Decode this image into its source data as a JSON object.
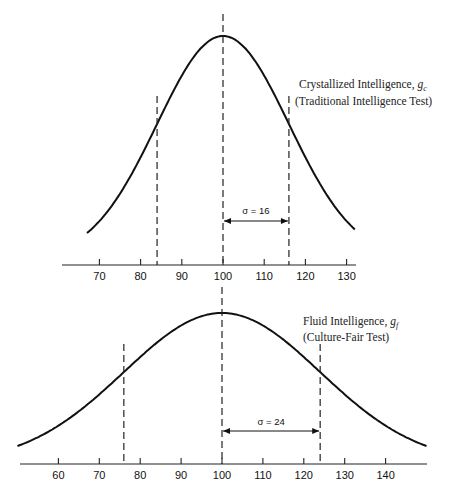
{
  "chart_data": [
    {
      "type": "line",
      "title": "Crystallized Intelligence, g_c (Traditional Intelligence Test)",
      "label_line1": "Crystallized Intelligence, g",
      "label_sub": "c",
      "label_line2": "(Traditional Intelligence Test)",
      "distribution": "normal",
      "mean": 100,
      "sd": 16,
      "sigma_label": "σ = 16",
      "marked_lines": [
        84,
        100,
        116
      ],
      "xlabel": "",
      "ylabel": "",
      "x_ticks": [
        70,
        80,
        90,
        100,
        110,
        120,
        130
      ],
      "x_tick_labels": [
        "70",
        "80",
        "90",
        "100",
        "110",
        "120",
        "130"
      ],
      "curve_range": [
        67,
        132
      ],
      "xlim": [
        60,
        134
      ],
      "grid": false
    },
    {
      "type": "line",
      "title": "Fluid Intelligence, g_f (Culture-Fair Test)",
      "label_line1": "Fluid Intelligence, g",
      "label_sub": "f",
      "label_line2": "(Culture-Fair Test)",
      "distribution": "normal",
      "mean": 100,
      "sd": 24,
      "sigma_label": "σ = 24",
      "marked_lines": [
        76,
        100,
        124
      ],
      "xlabel": "",
      "ylabel": "",
      "x_ticks": [
        60,
        70,
        80,
        90,
        100,
        110,
        120,
        130,
        140
      ],
      "x_tick_labels": [
        "60",
        "70",
        "80",
        "90",
        "100",
        "110",
        "120",
        "130",
        "140"
      ],
      "curve_range": [
        50,
        150
      ],
      "xlim": [
        50,
        150
      ],
      "grid": false
    }
  ]
}
